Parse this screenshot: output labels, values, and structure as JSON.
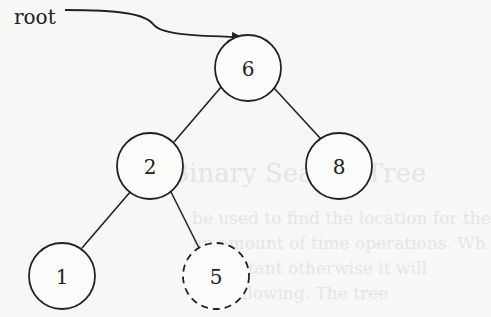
{
  "diagram": {
    "type": "binary-search-tree",
    "pointer_label": "root",
    "nodes": [
      {
        "id": "n6",
        "value": "6",
        "cx": 248,
        "cy": 68,
        "style": "solid"
      },
      {
        "id": "n2",
        "value": "2",
        "cx": 150,
        "cy": 166,
        "style": "solid"
      },
      {
        "id": "n8",
        "value": "8",
        "cx": 339,
        "cy": 166,
        "style": "solid"
      },
      {
        "id": "n1",
        "value": "1",
        "cx": 62,
        "cy": 276,
        "style": "solid"
      },
      {
        "id": "n5",
        "value": "5",
        "cx": 216,
        "cy": 276,
        "style": "dashed"
      }
    ],
    "edges": [
      {
        "from": "6",
        "to": "2"
      },
      {
        "from": "6",
        "to": "8"
      },
      {
        "from": "2",
        "to": "1"
      },
      {
        "from": "2",
        "to": "5"
      }
    ],
    "stroke_color": "#222222",
    "background_color": "#f7f7f5"
  },
  "bleed_through": {
    "line1": "Binary Search Tree",
    "line2": "be used to find the location for the",
    "line3": "an amount of time operations. Wh",
    "line4": "n constant otherwise it will",
    "line5": "the following. The tree"
  }
}
